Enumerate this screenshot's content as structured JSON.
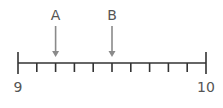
{
  "diagram": {
    "type": "number-line",
    "start_value": 9,
    "end_value": 10,
    "intervals": 10,
    "end_labels": {
      "start": "9",
      "end": "10"
    },
    "markers": [
      {
        "label": "A",
        "value": 9.2
      },
      {
        "label": "B",
        "value": 9.5
      }
    ],
    "colors": {
      "line": "#333333",
      "arrow": "#8a8a8a",
      "text": "#555555"
    }
  }
}
